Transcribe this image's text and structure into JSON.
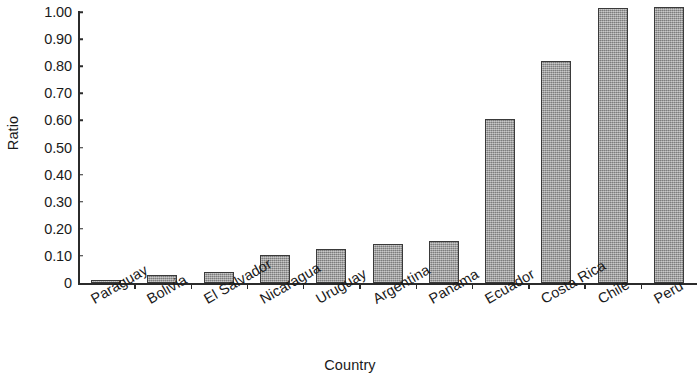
{
  "chart_data": {
    "type": "bar",
    "title": "",
    "xlabel": "Country",
    "ylabel": "Ratio",
    "categories": [
      "Paraguay",
      "Bolivia",
      "El Salvador",
      "Nicaragua",
      "Uruguay",
      "Argentina",
      "Panama",
      "Ecuador",
      "Costa Rica",
      "Chile",
      "Peru"
    ],
    "values": [
      0.01,
      0.03,
      0.04,
      0.105,
      0.125,
      0.145,
      0.155,
      0.605,
      0.82,
      1.015,
      1.02
    ],
    "ylim": [
      0,
      1.0
    ],
    "ytick_labels": [
      "0",
      "0.10",
      "0.20",
      "0.30",
      "0.40",
      "0.50",
      "0.60",
      "0.70",
      "0.80",
      "0.90",
      "1.00"
    ],
    "ytick_values": [
      0,
      0.1,
      0.2,
      0.3,
      0.4,
      0.5,
      0.6,
      0.7,
      0.8,
      0.9,
      1.0
    ],
    "grid": false,
    "legend": null,
    "bar_color": "#9a9a9a",
    "bar_border_color": "#3a3a3a",
    "axis_color": "#2b2b2b",
    "background": "#ffffff",
    "category_label_rotation": -30
  }
}
